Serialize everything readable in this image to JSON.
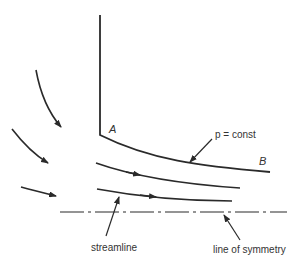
{
  "diagram": {
    "labels": {
      "point_a": "A",
      "point_b": "B",
      "pressure": "p = const",
      "streamline": "streamline",
      "symmetry": "line of symmetry"
    },
    "colors": {
      "line": "#2a2a2a",
      "text": "#333333",
      "background": "#ffffff"
    }
  }
}
